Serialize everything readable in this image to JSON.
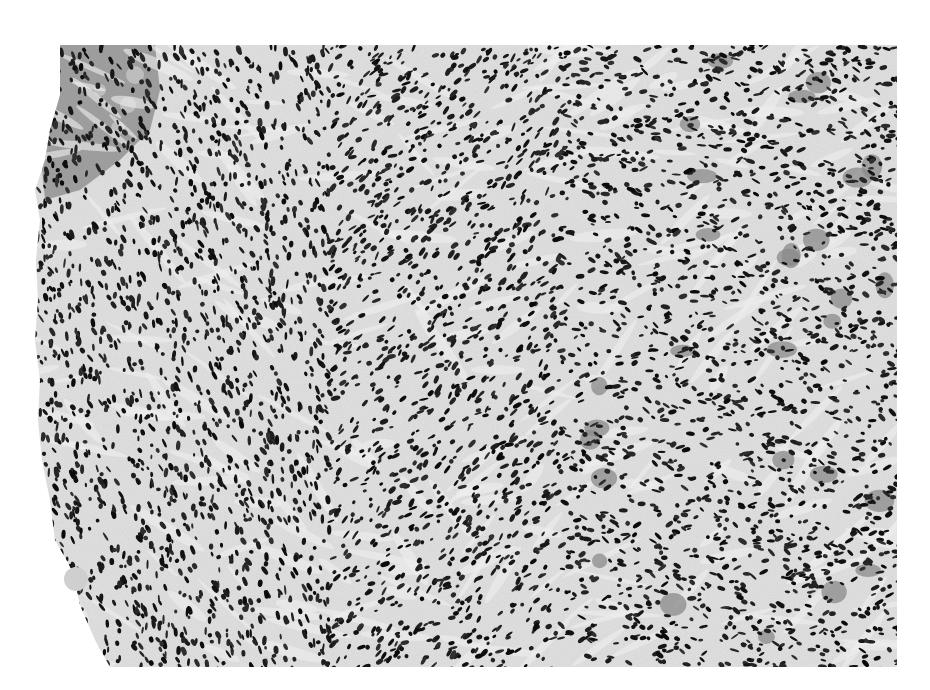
{
  "image": {
    "kind": "histology-micrograph",
    "stain": "grayscale (H&E-like)",
    "description": "Spindle-cell rich stroma with dense dark elongated nuclei, fascicular/storiform arrangement; epithelial fragment with vacuolated cells at upper-left edge",
    "width": 930,
    "height": 690,
    "background_color": "#ffffff",
    "tissue_bbox": {
      "x": 35,
      "y": 45,
      "width": 862,
      "height": 622
    },
    "colors": {
      "stroma": "#d8d8d8",
      "stroma_light": "#eeeeee",
      "nuclei": "#1a1a1a",
      "epithelium": "#6a6a6a",
      "giant_cell": "#8a8a8a"
    }
  }
}
